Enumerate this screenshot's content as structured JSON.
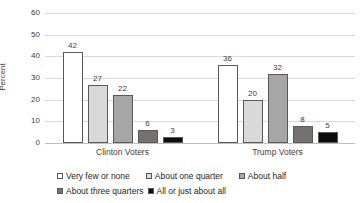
{
  "chart_data": {
    "type": "bar",
    "title": "",
    "xlabel": "",
    "ylabel": "Percent",
    "categories": [
      "Clinton Voters",
      "Trump Voters"
    ],
    "series": [
      {
        "name": "Very few or none",
        "values": [
          42,
          36
        ],
        "fill": "#FFFFFF"
      },
      {
        "name": "About one quarter",
        "values": [
          27,
          20
        ],
        "fill": "#D9D9D9"
      },
      {
        "name": "About half",
        "values": [
          22,
          32
        ],
        "fill": "#A6A6A6"
      },
      {
        "name": "About three quarters",
        "values": [
          6,
          8
        ],
        "fill": "#767171"
      },
      {
        "name": "All or just about all",
        "values": [
          3,
          5
        ],
        "fill": "#0D0D0D"
      }
    ],
    "ylim": [
      0,
      60
    ],
    "yticks": [
      0,
      10,
      20,
      30,
      40,
      50,
      60
    ],
    "grid": "horizontal",
    "data_labels": true,
    "legend_position": "bottom",
    "legend_rows": [
      [
        0,
        1,
        2
      ],
      [
        3,
        4
      ]
    ]
  },
  "colors": {
    "gridline": "#D9D9D9",
    "axis_line": "#BFBFBF",
    "text": "#404040",
    "bar_border": "#595959"
  }
}
